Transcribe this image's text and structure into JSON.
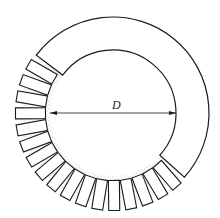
{
  "figure": {
    "type": "annular ring with segmented blocks",
    "dimension_label": "D",
    "center": [
      113,
      113
    ],
    "outer_radius": 96,
    "inner_radius": 63,
    "solid_arc": {
      "start_deg": 217,
      "end_deg": 402
    },
    "segment_arc": {
      "start_deg": 44,
      "end_deg": 215
    },
    "segment_count": 17,
    "colors": {
      "stroke": "#1a1a1a",
      "fill": "#ffffff",
      "stipple": "#777777",
      "background": "#ffffff"
    }
  }
}
